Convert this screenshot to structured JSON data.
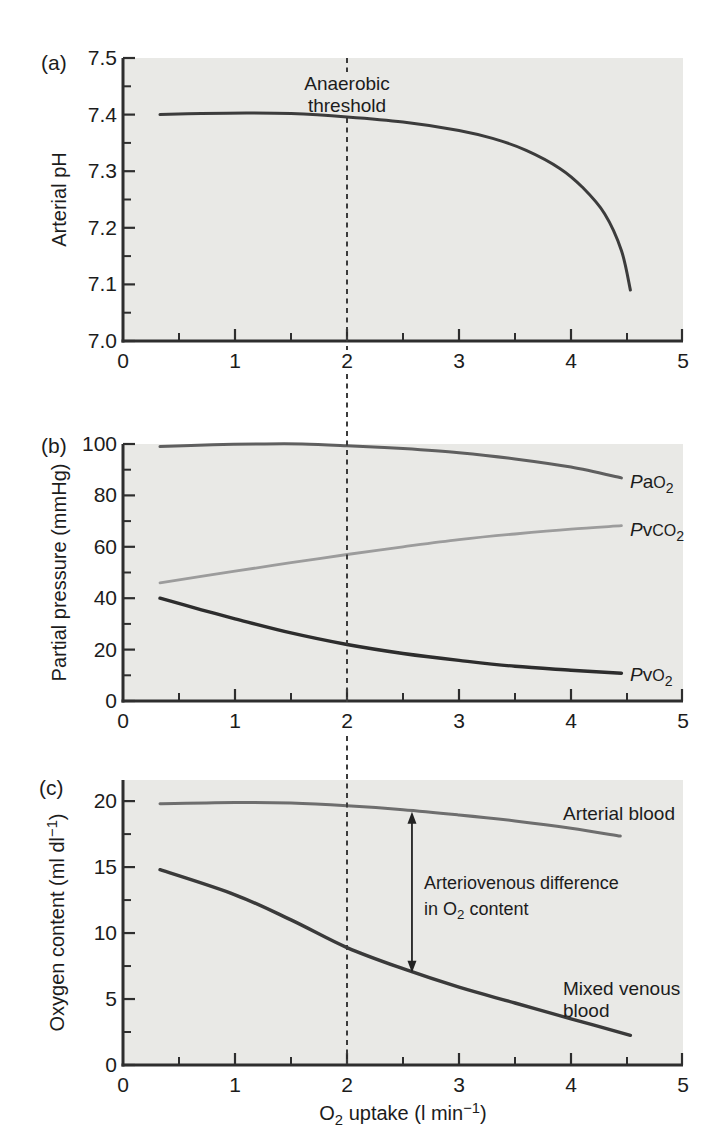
{
  "figure": {
    "background": "#ffffff",
    "plot_background": "#e9e9e6",
    "axis_color": "#2e2e2e",
    "text_color": "#1c1c1c",
    "dashed_line_color": "#3b3b3b",
    "arrow_color": "#222222",
    "xlabel_text": "O2 uptake (l min−1)",
    "xlabel_parts": [
      {
        "t": "O"
      },
      {
        "t": "2",
        "s": "sub"
      },
      {
        "t": " uptake (l min"
      },
      {
        "t": "−1",
        "s": "sup"
      },
      {
        "t": ")"
      }
    ],
    "threshold": {
      "x": 2,
      "line1": "Anaerobic",
      "line2": "threshold"
    },
    "av_arrow": {
      "x": 2.58,
      "y_top": 19.2,
      "y_bottom": 7.0,
      "label_line1": "Arteriovenous difference",
      "label_line2_text": "in O2 content",
      "label_line2_parts": [
        {
          "t": "in O"
        },
        {
          "t": "2",
          "s": "sub"
        },
        {
          "t": " content"
        }
      ]
    }
  },
  "chart_data": [
    {
      "panel": "a",
      "tag": "(a)",
      "type": "line",
      "title": "",
      "ylabel": "Arterial pH",
      "xlabel": "O2 uptake (l min−1)",
      "xlim": [
        0,
        5
      ],
      "ylim": [
        7.0,
        7.5
      ],
      "grid": false,
      "yticks": {
        "major": [
          7.0,
          7.1,
          7.2,
          7.3,
          7.4,
          7.5
        ],
        "minor": [
          7.05,
          7.15,
          7.25,
          7.35,
          7.45
        ],
        "labels": [
          "7.0",
          "7.1",
          "7.2",
          "7.3",
          "7.4",
          "7.5"
        ]
      },
      "xticks": {
        "major": [
          1,
          2,
          3,
          4
        ],
        "minor": [
          0.5,
          1.5,
          2.5,
          3.5,
          4.5
        ],
        "label_positions": [
          0,
          1,
          2,
          3,
          4,
          5
        ],
        "labels": [
          "0",
          "1",
          "2",
          "3",
          "4",
          "5"
        ]
      },
      "series": [
        {
          "name": "Arterial pH",
          "color": "#3c3c3c",
          "width": 3,
          "points": [
            [
              0.33,
              7.4
            ],
            [
              0.7,
              7.402
            ],
            [
              1.1,
              7.403
            ],
            [
              1.5,
              7.402
            ],
            [
              2.0,
              7.396
            ],
            [
              2.5,
              7.387
            ],
            [
              3.0,
              7.372
            ],
            [
              3.3,
              7.358
            ],
            [
              3.6,
              7.337
            ],
            [
              3.9,
              7.305
            ],
            [
              4.1,
              7.272
            ],
            [
              4.3,
              7.225
            ],
            [
              4.45,
              7.16
            ],
            [
              4.53,
              7.09
            ]
          ]
        }
      ],
      "annotation": {
        "text": [
          "Anaerobic",
          "threshold"
        ],
        "at_x": 2
      }
    },
    {
      "panel": "b",
      "tag": "(b)",
      "type": "line",
      "title": "",
      "ylabel": "Partial pressure (mmHg)",
      "xlabel": "O2 uptake (l min−1)",
      "xlim": [
        0,
        5
      ],
      "ylim": [
        0,
        100
      ],
      "grid": false,
      "yticks": {
        "major": [
          0,
          20,
          40,
          60,
          80,
          100
        ],
        "minor": [
          10,
          30,
          50,
          70,
          90
        ],
        "labels": [
          "0",
          "20",
          "40",
          "60",
          "80",
          "100"
        ]
      },
      "xticks": {
        "major": [
          1,
          2,
          3,
          4
        ],
        "minor": [
          0.5,
          1.5,
          2.5,
          3.5,
          4.5
        ],
        "label_positions": [
          0,
          1,
          2,
          3,
          4,
          5
        ],
        "labels": [
          "0",
          "1",
          "2",
          "3",
          "4",
          "5"
        ]
      },
      "series": [
        {
          "name": "PaO2",
          "label_parts": [
            {
              "t": "P",
              "s": "it"
            },
            {
              "t": "a"
            },
            {
              "t": "O",
              "s": "sc"
            },
            {
              "t": "2",
              "s": "sub"
            }
          ],
          "color": "#5f5f5f",
          "width": 3,
          "points": [
            [
              0.33,
              99
            ],
            [
              0.8,
              99.7
            ],
            [
              1.2,
              100
            ],
            [
              1.6,
              100
            ],
            [
              2.0,
              99.3
            ],
            [
              2.5,
              98.2
            ],
            [
              3.0,
              96.6
            ],
            [
              3.5,
              94.2
            ],
            [
              4.0,
              91.0
            ],
            [
              4.45,
              86.8
            ]
          ]
        },
        {
          "name": "PvCO2",
          "label_parts": [
            {
              "t": "P",
              "s": "it"
            },
            {
              "t": "v"
            },
            {
              "t": "CO",
              "s": "sc"
            },
            {
              "t": "2",
              "s": "sub"
            }
          ],
          "color": "#9c9c9c",
          "width": 2.8,
          "points": [
            [
              0.33,
              46
            ],
            [
              1.0,
              50.5
            ],
            [
              1.5,
              53.8
            ],
            [
              2.0,
              57
            ],
            [
              2.5,
              60
            ],
            [
              3.0,
              62.8
            ],
            [
              3.5,
              65
            ],
            [
              4.0,
              66.9
            ],
            [
              4.45,
              68.2
            ]
          ]
        },
        {
          "name": "PvO2",
          "label_parts": [
            {
              "t": "P",
              "s": "it"
            },
            {
              "t": "v"
            },
            {
              "t": "O",
              "s": "sc"
            },
            {
              "t": "2",
              "s": "sub"
            }
          ],
          "color": "#2d2d2d",
          "width": 3.4,
          "points": [
            [
              0.33,
              40
            ],
            [
              0.7,
              35.5
            ],
            [
              1.0,
              32
            ],
            [
              1.5,
              26.5
            ],
            [
              2.0,
              22
            ],
            [
              2.5,
              18.5
            ],
            [
              3.0,
              15.8
            ],
            [
              3.5,
              13.5
            ],
            [
              4.0,
              12.0
            ],
            [
              4.45,
              10.8
            ]
          ]
        }
      ]
    },
    {
      "panel": "c",
      "tag": "(c)",
      "type": "line",
      "title": "",
      "ylabel_text": "Oxygen content (ml dl−1)",
      "ylabel_parts": [
        {
          "t": "Oxygen content (ml dl"
        },
        {
          "t": "−1",
          "s": "sup"
        },
        {
          "t": ")"
        }
      ],
      "xlabel": "O2 uptake (l min−1)",
      "xlim": [
        0,
        5
      ],
      "ylim": [
        0,
        21.6
      ],
      "grid": false,
      "yticks": {
        "major": [
          0,
          5,
          10,
          15,
          20
        ],
        "minor": [
          2.5,
          7.5,
          12.5,
          17.5
        ],
        "labels": [
          "0",
          "5",
          "10",
          "15",
          "20"
        ]
      },
      "xticks": {
        "major": [
          1,
          2,
          3,
          4
        ],
        "minor": [
          0.5,
          1.5,
          2.5,
          3.5,
          4.5
        ],
        "label_positions": [
          0,
          1,
          2,
          3,
          4,
          5
        ],
        "labels": [
          "0",
          "1",
          "2",
          "3",
          "4",
          "5"
        ]
      },
      "series": [
        {
          "name": "Arterial blood",
          "label": "Arterial blood",
          "color": "#6e6e6e",
          "width": 3,
          "points": [
            [
              0.33,
              19.8
            ],
            [
              1.0,
              19.9
            ],
            [
              1.5,
              19.85
            ],
            [
              2.0,
              19.65
            ],
            [
              2.5,
              19.35
            ],
            [
              3.0,
              18.95
            ],
            [
              3.5,
              18.5
            ],
            [
              4.0,
              17.95
            ],
            [
              4.44,
              17.35
            ]
          ]
        },
        {
          "name": "Mixed venous blood",
          "label_line1": "Mixed venous",
          "label_line2": "blood",
          "color": "#3a3a3a",
          "width": 3.4,
          "points": [
            [
              0.33,
              14.8
            ],
            [
              1.0,
              12.9
            ],
            [
              1.5,
              11.0
            ],
            [
              2.0,
              8.9
            ],
            [
              2.5,
              7.3
            ],
            [
              3.0,
              5.9
            ],
            [
              3.5,
              4.7
            ],
            [
              4.0,
              3.5
            ],
            [
              4.53,
              2.25
            ]
          ]
        }
      ]
    }
  ]
}
